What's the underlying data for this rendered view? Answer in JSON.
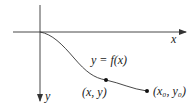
{
  "diagram": {
    "axes": {
      "x_label": "x",
      "y_label": "y",
      "origin": [
        40,
        32
      ],
      "x_axis_end": 186,
      "y_axis_end": 101
    },
    "curve": {
      "label": "y = f(x)",
      "shape": "descending sigmoid from origin"
    },
    "points": [
      {
        "name": "general-point",
        "label": "(x, y)",
        "pos": [
          106,
          80
        ]
      },
      {
        "name": "end-point",
        "label": "(x₀, y₀)",
        "pos": [
          147,
          91
        ]
      }
    ],
    "colors": {
      "stroke": "#333333",
      "text": "#222222",
      "background": "#ffffff"
    }
  }
}
